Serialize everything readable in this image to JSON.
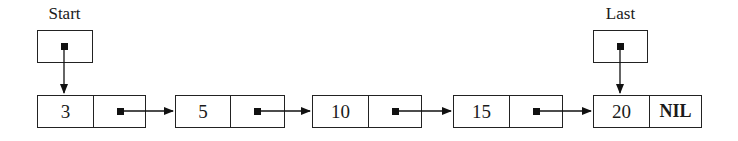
{
  "diagram": {
    "type": "singly-linked-list",
    "pointers": [
      {
        "label": "Start",
        "points_to_index": 0
      },
      {
        "label": "Last",
        "points_to_index": 4
      }
    ],
    "nodes": [
      {
        "value": "3",
        "next": "pointer"
      },
      {
        "value": "5",
        "next": "pointer"
      },
      {
        "value": "10",
        "next": "pointer"
      },
      {
        "value": "15",
        "next": "pointer"
      },
      {
        "value": "20",
        "next": "NIL"
      }
    ],
    "colors": {
      "stroke": "#222222",
      "background": "#ffffff",
      "text": "#1a1a1a"
    }
  }
}
